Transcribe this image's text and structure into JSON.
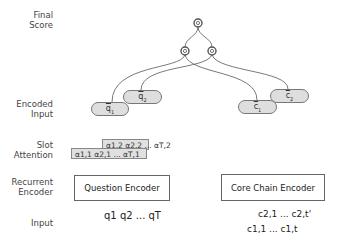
{
  "row_labels": {
    "final_score": "Final\nScore",
    "encoded_input": "Encoded\nInput",
    "slot_attention": "Slot\nAttention",
    "recurrent_encoder": "Recurrent\nEncoder",
    "input": "Input"
  },
  "encoded_input": {
    "q1": {
      "base": "q",
      "sub": "1"
    },
    "q2": {
      "base": "q",
      "sub": "2"
    },
    "c1": {
      "base": "c",
      "sub": "1"
    },
    "c2": {
      "base": "c",
      "sub": "2"
    }
  },
  "slot_attention": {
    "back": "α1,2 α2,2 ... αT,2",
    "front": "α1,1 α2,1 ... αT,1"
  },
  "encoders": {
    "question": "Question Encoder",
    "core_chain": "Core Chain Encoder"
  },
  "inputs": {
    "question": "q1 q2 ... qT",
    "core_chain_2": "c2,1 ... c2,t'",
    "core_chain_1": "c1,1 ... c1,t"
  },
  "colors": {
    "pill_fill": "#dedede",
    "stroke": "#555555",
    "text": "#333333"
  }
}
